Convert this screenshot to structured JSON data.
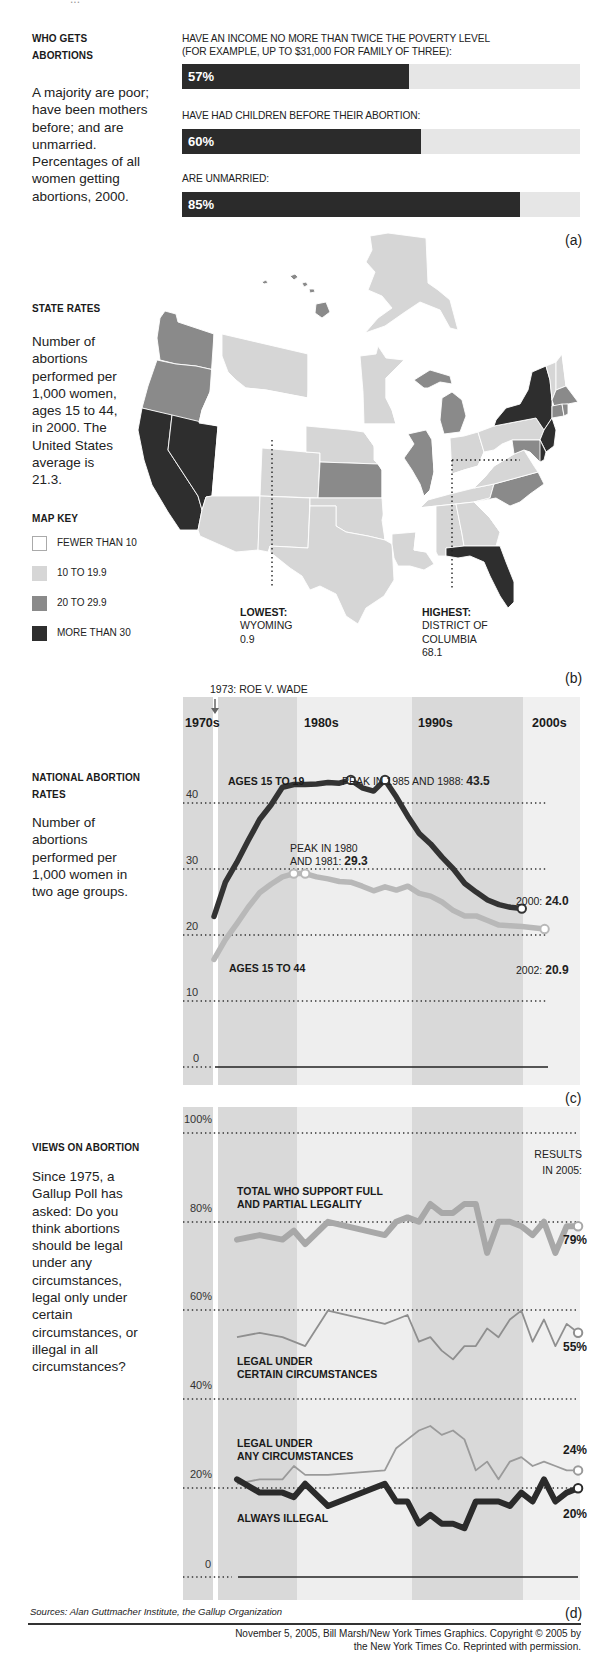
{
  "top_cutoff_text": "...",
  "panel_a": {
    "letter": "(a)",
    "heading_line1": "WHO GETS",
    "heading_line2": "ABORTIONS",
    "description": "A majority are poor; have been mothers before; and are unmarried. Percentages of all women getting abortions, 2000.",
    "bars": [
      {
        "label_line1": "HAVE AN INCOME NO MORE THAN TWICE THE POVERTY LEVEL",
        "label_line2": "(FOR EXAMPLE, UP TO $31,000 FOR FAMILY OF THREE):",
        "value": 57,
        "value_label": "57%"
      },
      {
        "label_line1": "HAVE HAD CHILDREN BEFORE THEIR ABORTION:",
        "label_line2": "",
        "value": 60,
        "value_label": "60%"
      },
      {
        "label_line1": "ARE UNMARRIED:",
        "label_line2": "",
        "value": 85,
        "value_label": "85%"
      }
    ]
  },
  "panel_b": {
    "letter": "(b)",
    "heading": "STATE RATES",
    "description": "Number of abortions performed per 1,000 women, ages 15 to 44, in 2000. The United States average is 21.3.",
    "map_key_title": "MAP KEY",
    "map_key": [
      {
        "label": "FEWER THAN 10",
        "color": "#ffffff"
      },
      {
        "label": "10 TO 19.9",
        "color": "#d6d6d6"
      },
      {
        "label": "20 TO 29.9",
        "color": "#8a8a8a"
      },
      {
        "label": "MORE THAN 30",
        "color": "#2e2e2e"
      }
    ],
    "lowest": {
      "title": "LOWEST:",
      "line1": "WYOMING",
      "line2": "0.9"
    },
    "highest": {
      "title": "HIGHEST:",
      "line1": "DISTRICT OF",
      "line2": "COLUMBIA",
      "line3": "68.1"
    }
  },
  "panel_c": {
    "letter": "(c)",
    "event_label": "1973: ROE V. WADE",
    "heading_line1": "NATIONAL ABORTION",
    "heading_line2": "RATES",
    "description": "Number of abortions performed per 1,000 women in two age groups.",
    "decades": [
      "1970s",
      "1980s",
      "1990s",
      "2000s"
    ],
    "yticks": [
      "40",
      "30",
      "20",
      "10",
      "0"
    ],
    "series_label_teen": "AGES 15 TO 19",
    "series_label_all": "AGES 15 TO 44",
    "peak_teen_text": "PEAK IN 1985 AND 1988: ",
    "peak_teen_value": "43.5",
    "peak_all_line1": "PEAK IN 1980",
    "peak_all_line2": "AND 1981: ",
    "peak_all_value": "29.3",
    "end_teen_text": "2000: ",
    "end_teen_value": "24.0",
    "end_all_text": "2002: ",
    "end_all_value": "20.9"
  },
  "panel_d": {
    "letter": "(d)",
    "heading": "VIEWS ON ABORTION",
    "description": "Since 1975, a Gallup Poll has asked: Do you think abortions should be legal under any circumstances, legal only under certain circumstances, or illegal in all circumstances?",
    "yticks": [
      "100%",
      "80%",
      "60%",
      "40%",
      "20%",
      "0"
    ],
    "results_line1": "RESULTS",
    "results_line2": "IN 2005:",
    "label_total_line1": "TOTAL WHO SUPPORT FULL",
    "label_total_line2": "AND PARTIAL LEGALITY",
    "label_certain_line1": "LEGAL UNDER",
    "label_certain_line2": "CERTAIN CIRCUMSTANCES",
    "label_any_line1": "LEGAL UNDER",
    "label_any_line2": "ANY CIRCUMSTANCES",
    "label_illegal": "ALWAYS ILLEGAL",
    "end_total": "79%",
    "end_certain": "55%",
    "end_any": "24%",
    "end_illegal": "20%"
  },
  "footer": {
    "sources": "Sources: Alan Guttmacher Institute, the Gallup Organization",
    "credit_line1": "November 5, 2005, Bill Marsh/New York Times Graphics. Copyright © 2005 by",
    "credit_line2": "the New York Times Co. Reprinted with permission."
  },
  "chart_data": [
    {
      "type": "bar",
      "title": "WHO GETS ABORTIONS",
      "subtitle": "Percentages of all women getting abortions, 2000",
      "categories": [
        "Income no more than twice the poverty level",
        "Had children before their abortion",
        "Unmarried"
      ],
      "values": [
        57,
        60,
        85
      ],
      "xlim": [
        0,
        100
      ],
      "orientation": "horizontal"
    },
    {
      "type": "choropleth",
      "title": "STATE RATES",
      "subtitle": "Abortions per 1,000 women ages 15 to 44, 2000; U.S. average 21.3",
      "bins": [
        "Fewer than 10",
        "10 to 19.9",
        "20 to 29.9",
        "More than 30"
      ],
      "annotations": [
        {
          "label": "Lowest: Wyoming",
          "value": 0.9
        },
        {
          "label": "Highest: District of Columbia",
          "value": 68.1
        }
      ],
      "states_by_bin": {
        "More than 30": [
          "CA",
          "NV",
          "NY",
          "NJ",
          "FL",
          "DC"
        ],
        "20 to 29.9": [
          "WA",
          "OR",
          "HI",
          "MI",
          "IL",
          "KS",
          "NC",
          "MA",
          "CT",
          "MD",
          "DE",
          "RI"
        ],
        "10 to 19.9": [
          "AK",
          "MT",
          "MN",
          "AZ",
          "CO",
          "NM",
          "TX",
          "OK",
          "NE",
          "LA",
          "AL",
          "GA",
          "TN",
          "OH",
          "PA",
          "VA",
          "VT",
          "NH",
          "ME"
        ],
        "Fewer than 10": [
          "ID",
          "WY",
          "UT",
          "ND",
          "SD",
          "IA",
          "MO",
          "AR",
          "MS",
          "KY",
          "WV",
          "IN",
          "WI",
          "SC"
        ]
      }
    },
    {
      "type": "line",
      "title": "NATIONAL ABORTION RATES",
      "ylabel": "Abortions per 1,000 women",
      "ylim": [
        0,
        45
      ],
      "yticks": [
        0,
        10,
        20,
        30,
        40
      ],
      "grid": true,
      "x": [
        1973,
        1974,
        1975,
        1976,
        1977,
        1978,
        1979,
        1980,
        1981,
        1982,
        1983,
        1984,
        1985,
        1986,
        1987,
        1988,
        1989,
        1990,
        1991,
        1992,
        1993,
        1994,
        1995,
        1996,
        1997,
        1998,
        1999,
        2000,
        2001,
        2002
      ],
      "series": [
        {
          "name": "AGES 15 TO 19",
          "values": [
            22.8,
            28.0,
            31.0,
            34.3,
            37.5,
            39.7,
            42.4,
            42.8,
            42.8,
            42.9,
            43.1,
            43.0,
            43.5,
            42.3,
            41.8,
            43.5,
            40.9,
            38.0,
            35.4,
            33.8,
            31.8,
            30.0,
            27.8,
            26.5,
            25.3,
            24.6,
            24.2,
            24.0,
            null,
            null
          ]
        },
        {
          "name": "AGES 15 TO 44",
          "values": [
            16.3,
            19.3,
            21.7,
            24.2,
            26.4,
            27.7,
            28.8,
            29.3,
            29.3,
            28.8,
            28.5,
            28.1,
            28.0,
            27.4,
            26.7,
            27.3,
            26.8,
            27.4,
            26.3,
            25.9,
            25.0,
            23.7,
            22.9,
            22.9,
            22.2,
            21.5,
            21.4,
            21.3,
            21.1,
            20.9
          ]
        }
      ],
      "annotations": [
        "1973: ROE V. WADE",
        "PEAK IN 1985 AND 1988: 43.5",
        "PEAK IN 1980 AND 1981: 29.3",
        "2000: 24.0",
        "2002: 20.9"
      ]
    },
    {
      "type": "line",
      "title": "VIEWS ON ABORTION",
      "ylabel": "Percent",
      "ylim": [
        0,
        100
      ],
      "yticks": [
        0,
        20,
        40,
        60,
        80,
        100
      ],
      "grid": true,
      "x": [
        1975,
        1977,
        1979,
        1980,
        1981,
        1983,
        1988,
        1989,
        1990,
        1991,
        1992,
        1993,
        1994,
        1995,
        1996,
        1997,
        1998,
        1999,
        2000,
        2001,
        2002,
        2003,
        2004,
        2005
      ],
      "series": [
        {
          "name": "TOTAL WHO SUPPORT FULL AND PARTIAL LEGALITY",
          "values": [
            76,
            77,
            76,
            78,
            75,
            80,
            77,
            80,
            81,
            80,
            84,
            82,
            82,
            84,
            84,
            73,
            80,
            80,
            79,
            77,
            80,
            73,
            79,
            79
          ]
        },
        {
          "name": "LEGAL UNDER CERTAIN CIRCUMSTANCES",
          "values": [
            54,
            55,
            54,
            53,
            52,
            60,
            57,
            58,
            59,
            53,
            54,
            51,
            49,
            52,
            52,
            56,
            54,
            58,
            60,
            53,
            58,
            52,
            57,
            55
          ]
        },
        {
          "name": "LEGAL UNDER ANY CIRCUMSTANCES",
          "values": [
            21,
            22,
            22,
            25,
            23,
            23,
            24,
            29,
            31,
            33,
            34,
            32,
            33,
            31,
            24,
            26,
            22,
            26,
            27,
            25,
            26,
            25,
            24,
            24
          ]
        },
        {
          "name": "ALWAYS ILLEGAL",
          "values": [
            22,
            19,
            19,
            18,
            21,
            16,
            21,
            17,
            17,
            12,
            14,
            12,
            12,
            11,
            17,
            17,
            17,
            16,
            19,
            17,
            22,
            17,
            19,
            20
          ]
        }
      ],
      "annotations": [
        "RESULTS IN 2005: 79%, 55%, 24%, 20%"
      ]
    }
  ]
}
